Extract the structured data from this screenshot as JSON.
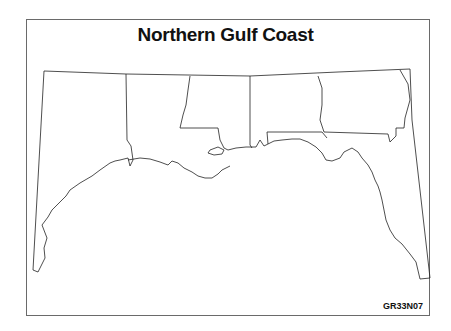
{
  "map": {
    "title": "Northern Gulf Coast",
    "code": "GR33N07",
    "regions": [
      "Texas",
      "Louisiana",
      "Mississippi",
      "Alabama",
      "Georgia",
      "Florida"
    ],
    "colors": {
      "lines": "#222222",
      "background": "#ffffff",
      "frame": "#6a6a6a"
    }
  }
}
